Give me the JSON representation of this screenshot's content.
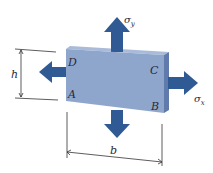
{
  "diagram": {
    "type": "biaxial stress element",
    "colors": {
      "plate_front": "#8fa6cc",
      "plate_top": "#a9bbd9",
      "plate_side": "#5f7aab",
      "arrow": "#2f5a93",
      "line": "#333333",
      "label": "#2a2a3a"
    },
    "corners": {
      "A": "A",
      "B": "B",
      "C": "C",
      "D": "D"
    },
    "stresses": {
      "x": "σx",
      "y": "σy"
    },
    "stress_labels": {
      "x_main": "σ",
      "x_sub": "x",
      "y_main": "σ",
      "y_sub": "y"
    },
    "dimensions": {
      "height": "h",
      "width": "b"
    }
  }
}
